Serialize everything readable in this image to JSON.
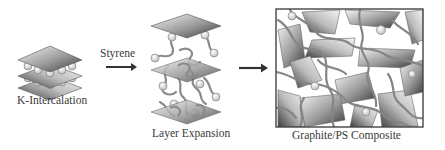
{
  "diagram": {
    "stages": [
      {
        "id": "k-intercalation",
        "label": "K-Intercalation"
      },
      {
        "id": "layer-expansion",
        "label": "Layer Expansion"
      },
      {
        "id": "composite",
        "label": "Graphite/PS Composite"
      }
    ],
    "arrows": [
      {
        "from": "k-intercalation",
        "to": "layer-expansion",
        "label": "Styrene"
      },
      {
        "from": "layer-expansion",
        "to": "composite",
        "label": ""
      }
    ],
    "colors": {
      "sheet_dark": "#4a4a4a",
      "sheet_light": "#f2f2f2",
      "polymer": "#808080",
      "arrow": "#333333",
      "frame": "#444444"
    }
  }
}
